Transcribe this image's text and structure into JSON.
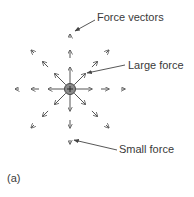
{
  "figure": {
    "panel_label": "(a)",
    "annotations": {
      "force_vectors": "Force vectors",
      "large_force": "Large force",
      "small_force": "Small force"
    },
    "charge": {
      "symbol": "+",
      "fill": "#8a8a8a",
      "stroke": "#444444"
    },
    "colors": {
      "line": "#555555",
      "text": "#3a3a3a"
    },
    "field": {
      "center": [
        70,
        89
      ],
      "directions_deg": [
        0,
        45,
        90,
        135,
        180,
        225,
        270,
        315
      ],
      "rings": [
        {
          "tip_distance": 22,
          "length": 17,
          "size": "large"
        },
        {
          "tip_distance": 39,
          "length": 8,
          "size": "medium"
        },
        {
          "tip_distance": 55,
          "length": 4,
          "size": "small"
        }
      ]
    }
  }
}
